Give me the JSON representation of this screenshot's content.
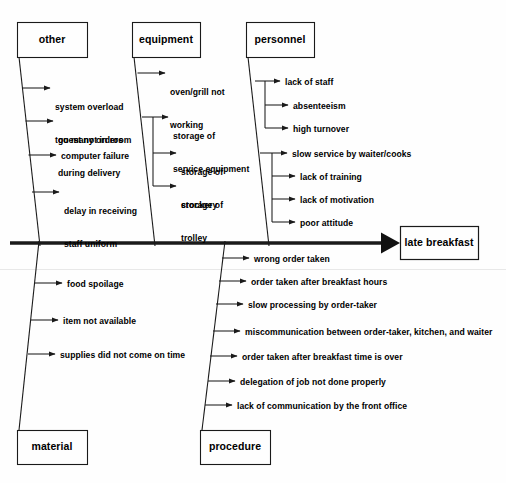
{
  "diagram": {
    "type": "fishbone-ishikawa",
    "head": {
      "label": "late breakfast"
    },
    "categories": [
      {
        "id": "other",
        "label": "other",
        "position": "top-left",
        "causes": [
          {
            "text": "system overload\ntoo many orders",
            "lines": [
              "system overload",
              "too many orders"
            ]
          },
          {
            "text": "guest not in room\nduring delivery",
            "lines": [
              "guest not in room",
              "during delivery"
            ]
          },
          {
            "text": "computer failure",
            "lines": [
              "computer failure"
            ]
          },
          {
            "text": "delay in receiving\nstaff uniform",
            "lines": [
              "delay in receiving",
              "staff uniform"
            ]
          }
        ]
      },
      {
        "id": "equipment",
        "label": "equipment",
        "position": "top-middle",
        "causes": [
          {
            "text": "oven/grill not\nworking",
            "lines": [
              "oven/grill not",
              "working"
            ]
          },
          {
            "text": "storage of\nservice equipment",
            "lines": [
              "storage of",
              "service equipment"
            ]
          },
          {
            "text": "storage of\ncrockery",
            "lines": [
              "storage of",
              "crockery"
            ]
          },
          {
            "text": "storage of\ntrolley",
            "lines": [
              "storage of",
              "trolley"
            ]
          }
        ]
      },
      {
        "id": "personnel",
        "label": "personnel",
        "position": "top-right",
        "causes": [
          {
            "text": "lack of staff",
            "lines": [
              "lack of staff"
            ]
          },
          {
            "text": "absenteeism",
            "lines": [
              "absenteeism"
            ]
          },
          {
            "text": "high turnover",
            "lines": [
              "high turnover"
            ]
          },
          {
            "text": "slow service by waiter/cooks",
            "lines": [
              "slow service by waiter/cooks"
            ]
          },
          {
            "text": "lack of training",
            "lines": [
              "lack of training"
            ]
          },
          {
            "text": "lack of motivation",
            "lines": [
              "lack of motivation"
            ]
          },
          {
            "text": "poor attitude",
            "lines": [
              "poor attitude"
            ]
          }
        ]
      },
      {
        "id": "material",
        "label": "material",
        "position": "bottom-left",
        "causes": [
          {
            "text": "food spoilage",
            "lines": [
              "food spoilage"
            ]
          },
          {
            "text": "item not available",
            "lines": [
              "item not available"
            ]
          },
          {
            "text": "supplies did not come on time",
            "lines": [
              "supplies did not come on time"
            ]
          }
        ]
      },
      {
        "id": "procedure",
        "label": "procedure",
        "position": "bottom-right",
        "causes": [
          {
            "text": "wrong order taken",
            "lines": [
              "wrong order taken"
            ]
          },
          {
            "text": "order taken after breakfast hours",
            "lines": [
              "order taken after breakfast hours"
            ]
          },
          {
            "text": "slow processing by order-taker",
            "lines": [
              "slow processing by order-taker"
            ]
          },
          {
            "text": "miscommunication between order-taker, kitchen, and waiter",
            "lines": [
              "miscommunication between order-taker, kitchen, and waiter"
            ]
          },
          {
            "text": "order taken after breakfast time is over",
            "lines": [
              "order taken after breakfast time is over"
            ]
          },
          {
            "text": "delegation of job not done properly",
            "lines": [
              "delegation of job not done properly"
            ]
          },
          {
            "text": "lack of communication by the front office",
            "lines": [
              "lack of communication by the front office"
            ]
          }
        ]
      }
    ],
    "colors": {
      "line": "#1a1a1a",
      "text": "#000000",
      "background": "#fefefe",
      "box_border": "#1a1a1a"
    }
  },
  "labels": {
    "other": "other",
    "equipment": "equipment",
    "personnel": "personnel",
    "material": "material",
    "procedure": "procedure",
    "head": "late breakfast",
    "other_c0_l0": "system overload",
    "other_c0_l1": "too many orders",
    "other_c1_l0": "guest not in room",
    "other_c1_l1": "during delivery",
    "other_c2_l0": "computer failure",
    "other_c3_l0": "delay in receiving",
    "other_c3_l1": "staff uniform",
    "equip_c0_l0": "oven/grill not",
    "equip_c0_l1": "working",
    "equip_c1_l0": "storage of",
    "equip_c1_l1": "service equipment",
    "equip_c2_l0": "storage of",
    "equip_c2_l1": "crockery",
    "equip_c3_l0": "storage of",
    "equip_c3_l1": "trolley",
    "pers_c0": "lack of staff",
    "pers_c1": "absenteeism",
    "pers_c2": "high turnover",
    "pers_c3": "slow service by waiter/cooks",
    "pers_c4": "lack of training",
    "pers_c5": "lack of motivation",
    "pers_c6": "poor attitude",
    "mat_c0": "food spoilage",
    "mat_c1": "item not available",
    "mat_c2": "supplies did not come on time",
    "proc_c0": "wrong order taken",
    "proc_c1": "order taken after breakfast hours",
    "proc_c2": "slow processing by order-taker",
    "proc_c3": "miscommunication between order-taker, kitchen, and waiter",
    "proc_c4": "order taken after breakfast time is over",
    "proc_c5": "delegation of job not done properly",
    "proc_c6": "lack of communication by the front office"
  }
}
